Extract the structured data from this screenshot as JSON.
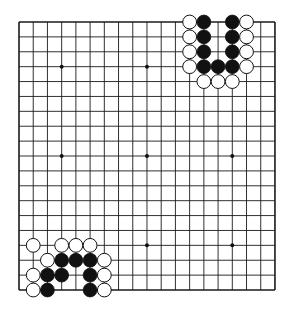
{
  "board": {
    "size": 19,
    "origin_x": 19,
    "origin_y": 22,
    "step_x": 14.22,
    "step_y": 14.89,
    "line_color": "#1a1a1a",
    "background": "#ffffff",
    "star_points": [
      [
        3,
        3
      ],
      [
        9,
        3
      ],
      [
        3,
        9
      ],
      [
        9,
        9
      ],
      [
        15,
        9
      ],
      [
        9,
        15
      ],
      [
        15,
        15
      ]
    ],
    "stones": [
      {
        "color": "white",
        "col": 12,
        "row": 0
      },
      {
        "color": "black",
        "col": 13,
        "row": 0
      },
      {
        "color": "black",
        "col": 15,
        "row": 0
      },
      {
        "color": "white",
        "col": 16,
        "row": 0
      },
      {
        "color": "white",
        "col": 12,
        "row": 1
      },
      {
        "color": "black",
        "col": 13,
        "row": 1
      },
      {
        "color": "black",
        "col": 15,
        "row": 1
      },
      {
        "color": "white",
        "col": 16,
        "row": 1
      },
      {
        "color": "white",
        "col": 12,
        "row": 2
      },
      {
        "color": "black",
        "col": 13,
        "row": 2
      },
      {
        "color": "black",
        "col": 15,
        "row": 2
      },
      {
        "color": "white",
        "col": 16,
        "row": 2
      },
      {
        "color": "white",
        "col": 12,
        "row": 3
      },
      {
        "color": "black",
        "col": 13,
        "row": 3
      },
      {
        "color": "black",
        "col": 14,
        "row": 3
      },
      {
        "color": "black",
        "col": 15,
        "row": 3
      },
      {
        "color": "white",
        "col": 16,
        "row": 3
      },
      {
        "color": "white",
        "col": 13,
        "row": 4
      },
      {
        "color": "white",
        "col": 14,
        "row": 4
      },
      {
        "color": "white",
        "col": 15,
        "row": 4
      },
      {
        "color": "white",
        "col": 1,
        "row": 15
      },
      {
        "color": "white",
        "col": 3,
        "row": 15
      },
      {
        "color": "white",
        "col": 4,
        "row": 15
      },
      {
        "color": "white",
        "col": 5,
        "row": 15
      },
      {
        "color": "white",
        "col": 2,
        "row": 16
      },
      {
        "color": "black",
        "col": 3,
        "row": 16
      },
      {
        "color": "black",
        "col": 4,
        "row": 16
      },
      {
        "color": "black",
        "col": 5,
        "row": 16
      },
      {
        "color": "white",
        "col": 6,
        "row": 16
      },
      {
        "color": "white",
        "col": 1,
        "row": 17
      },
      {
        "color": "black",
        "col": 2,
        "row": 17
      },
      {
        "color": "black",
        "col": 3,
        "row": 17
      },
      {
        "color": "black",
        "col": 5,
        "row": 17
      },
      {
        "color": "white",
        "col": 6,
        "row": 17
      },
      {
        "color": "white",
        "col": 1,
        "row": 18
      },
      {
        "color": "black",
        "col": 2,
        "row": 18
      },
      {
        "color": "black",
        "col": 5,
        "row": 18
      },
      {
        "color": "white",
        "col": 6,
        "row": 18
      }
    ]
  }
}
